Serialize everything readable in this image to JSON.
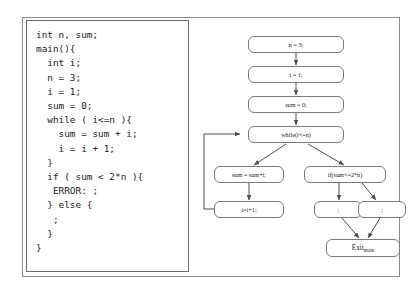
{
  "figure": {
    "frame_label": "figure-frame",
    "border_color": "#8a8a8a"
  },
  "code_panel": {
    "language": "C",
    "listing": "int n, sum;\nmain(){\n  int i;\n  n = 3;\n  i = 1;\n  sum = 0;\n  while ( i<=n ){\n    sum = sum + i;\n    i = i + 1;\n  }\n  if ( sum < 2*n ){\n   ERROR: ;\n  } else {\n   ;\n  }\n}",
    "lines": [
      "int n, sum;",
      "main(){",
      "  int i;",
      "  n = 3;",
      "  i = 1;",
      "  sum = 0;",
      "  while ( i<=n ){",
      "    sum = sum + i;",
      "    i = i + 1;",
      "  }",
      "  if ( sum < 2*n ){",
      "   ERROR: ;",
      "  } else {",
      "   ;",
      "  }",
      "}"
    ]
  },
  "flow_graph": {
    "type": "control-flow-graph",
    "node_border_color": "#7a7a7a",
    "edge_color": "#555555",
    "nodes": [
      {
        "id": "n3",
        "label": "n = 3;"
      },
      {
        "id": "i1",
        "label": "i = 1;"
      },
      {
        "id": "sum0",
        "label": "sum = 0;"
      },
      {
        "id": "while",
        "label": "while(i<=n)"
      },
      {
        "id": "sumadd",
        "label": "sum = sum+i;"
      },
      {
        "id": "iadd",
        "label": "i=i+1;"
      },
      {
        "id": "if",
        "label": "if(sum<=2*n)"
      },
      {
        "id": "skipL",
        "label": ";"
      },
      {
        "id": "skipR",
        "label": ";"
      },
      {
        "id": "exit",
        "label": "Exit",
        "sublabel": "main"
      }
    ],
    "edges": [
      {
        "from": "n3",
        "to": "i1"
      },
      {
        "from": "i1",
        "to": "sum0"
      },
      {
        "from": "sum0",
        "to": "while"
      },
      {
        "from": "while",
        "to": "sumadd"
      },
      {
        "from": "while",
        "to": "if"
      },
      {
        "from": "sumadd",
        "to": "iadd"
      },
      {
        "from": "iadd",
        "to": "while",
        "kind": "loop-back"
      },
      {
        "from": "if",
        "to": "skipL"
      },
      {
        "from": "if",
        "to": "skipR"
      },
      {
        "from": "skipL",
        "to": "exit"
      },
      {
        "from": "skipR",
        "to": "exit"
      }
    ]
  }
}
